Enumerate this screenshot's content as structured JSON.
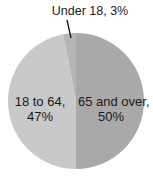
{
  "chart_data": {
    "type": "pie",
    "title": "",
    "slices": [
      {
        "label": "65 and over",
        "value": 50,
        "color": "#a9a9a9"
      },
      {
        "label": "18 to 64",
        "value": 47,
        "color": "#c9c9c9"
      },
      {
        "label": "Under 18",
        "value": 3,
        "color": "#b6b6b6"
      }
    ],
    "start_angle_deg": 0,
    "direction": "clockwise",
    "legend": "none",
    "labels_inside": true
  },
  "labels": {
    "under18": "Under 18, 3%",
    "age18to64_line1": "18 to 64,",
    "age18to64_line2": "47%",
    "age65plus_line1": "65 and over,",
    "age65plus_line2": "50%"
  },
  "geometry": {
    "cx": 76,
    "cy": 101,
    "r": 68
  }
}
